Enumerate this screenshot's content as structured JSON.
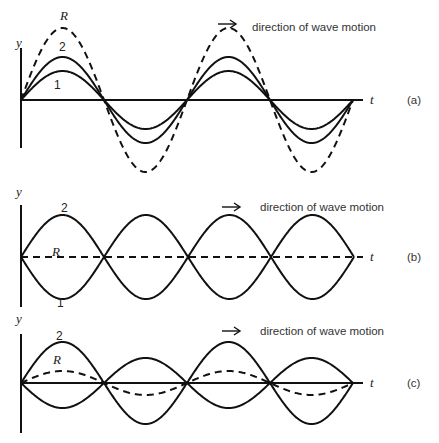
{
  "panels": [
    {
      "id": "a",
      "tag": "(a)",
      "baseline": 100,
      "axis_top": 48,
      "axis_bottom": 148,
      "t_axis_dashed": false,
      "direction_label": "direction of wave motion",
      "arrow": {
        "x": 218,
        "y": 24
      },
      "text_x": 252,
      "text_y": 31,
      "labels": [
        {
          "text": "R",
          "kind": "lbl",
          "x": 60,
          "y": 20
        },
        {
          "text": "2",
          "kind": "num",
          "x": 59,
          "y": 51
        },
        {
          "text": "1",
          "kind": "num",
          "x": 54,
          "y": 89
        },
        {
          "text": "y",
          "kind": "lbl",
          "x": 16,
          "y": 47
        }
      ],
      "waves": [
        {
          "name": "1",
          "amp": 29,
          "phase": 0,
          "dashed": false
        },
        {
          "name": "2",
          "amp": 43,
          "phase": 0,
          "dashed": false
        },
        {
          "name": "R",
          "amp": 72,
          "phase": 0,
          "dashed": true
        }
      ],
      "nodes_x": [
        21,
        104,
        187,
        270,
        353
      ],
      "wave_type": "sine"
    },
    {
      "id": "b",
      "tag": "(b)",
      "baseline": 257,
      "axis_top": 205,
      "axis_bottom": 307,
      "t_axis_dashed": true,
      "direction_label": "direction of wave motion",
      "arrow": {
        "x": 222,
        "y": 207
      },
      "text_x": 260,
      "text_y": 211,
      "labels": [
        {
          "text": "2",
          "kind": "num",
          "x": 61,
          "y": 212
        },
        {
          "text": "R",
          "kind": "lbl",
          "x": 52,
          "y": 256
        },
        {
          "text": "1",
          "kind": "num",
          "x": 57,
          "y": 307
        },
        {
          "text": "y",
          "kind": "lbl",
          "x": 16,
          "y": 196
        }
      ],
      "waves": [
        {
          "name": "2",
          "amp": 42,
          "phase": 0,
          "dashed": false
        },
        {
          "name": "1",
          "amp": -42,
          "phase": 0,
          "dashed": false
        }
      ],
      "nodes_x": [
        21,
        104,
        188,
        271,
        354
      ],
      "wave_type": "sine"
    },
    {
      "id": "c",
      "tag": "(c)",
      "baseline": 383,
      "axis_top": 334,
      "axis_bottom": 433,
      "t_axis_dashed": false,
      "direction_label": "direction of wave motion",
      "arrow": {
        "x": 222,
        "y": 331
      },
      "text_x": 260,
      "text_y": 335,
      "labels": [
        {
          "text": "2",
          "kind": "num",
          "x": 56,
          "y": 340
        },
        {
          "text": "R",
          "kind": "lbl",
          "x": 53,
          "y": 364
        },
        {
          "text": "y",
          "kind": "lbl",
          "x": 16,
          "y": 323
        }
      ],
      "waves": [
        {
          "name": "2",
          "amp": 41,
          "phase": 0,
          "dashed": false
        },
        {
          "name": "1",
          "amp": -25,
          "phase": 0,
          "dashed": false
        },
        {
          "name": "R",
          "amp": 12,
          "phase": 0,
          "dashed": true
        }
      ],
      "nodes_x": [
        21,
        104,
        187,
        270,
        353
      ],
      "wave_type": "sine"
    }
  ],
  "axis_x_start": 21,
  "axis_x_end": 363,
  "t_label": "t",
  "t_label_x": 370,
  "tag_x": 407,
  "colors": {
    "stroke": "#111111",
    "text": "#222222"
  }
}
